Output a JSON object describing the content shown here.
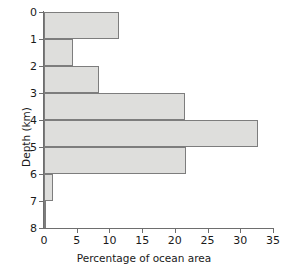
{
  "chart_data": {
    "type": "bar",
    "orientation": "horizontal",
    "title": "",
    "xlabel": "Percentage of ocean area",
    "ylabel": "Depth (km)",
    "xlim": [
      0,
      35
    ],
    "ylim": [
      0,
      8
    ],
    "grid": false,
    "legend": null,
    "xticks": [
      0,
      5,
      10,
      15,
      20,
      25,
      30,
      35
    ],
    "xtick_labels": [
      "0",
      "5",
      "10",
      "15",
      "20",
      "25",
      "30",
      "35"
    ],
    "yticks": [
      0,
      1,
      2,
      3,
      4,
      5,
      6,
      7,
      8
    ],
    "ytick_labels": [
      "0",
      "1",
      "2",
      "3",
      "4",
      "5",
      "6",
      "7",
      "8"
    ],
    "categories": [
      "0-1",
      "1-2",
      "2-3",
      "3-4",
      "4-5",
      "5-6",
      "6-7",
      "7-8"
    ],
    "bins": [
      {
        "depth_top": 0,
        "depth_bottom": 1,
        "value": 11.5
      },
      {
        "depth_top": 1,
        "depth_bottom": 2,
        "value": 4.4
      },
      {
        "depth_top": 2,
        "depth_bottom": 3,
        "value": 8.4
      },
      {
        "depth_top": 3,
        "depth_bottom": 4,
        "value": 21.5
      },
      {
        "depth_top": 4,
        "depth_bottom": 5,
        "value": 32.7
      },
      {
        "depth_top": 5,
        "depth_bottom": 6,
        "value": 21.7
      },
      {
        "depth_top": 6,
        "depth_bottom": 7,
        "value": 1.4
      },
      {
        "depth_top": 7,
        "depth_bottom": 8,
        "value": 0.2
      }
    ],
    "values": [
      11.5,
      4.4,
      8.4,
      21.5,
      32.7,
      21.7,
      1.4,
      0.2
    ],
    "colors": {
      "bar_fill": "#dededc",
      "bar_stroke": "#7d7d7d",
      "axis": "#6e6e6e",
      "text": "#1a1a1a",
      "background": "#ffffff"
    }
  }
}
